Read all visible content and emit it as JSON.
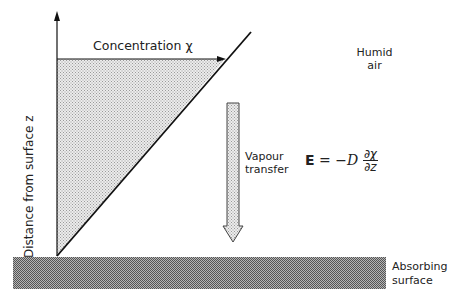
{
  "diagram": {
    "axis_label": "Distance from surface z",
    "concentration_label": "Concentration χ",
    "humid_air": [
      "Humid",
      "air"
    ],
    "vapour_transfer": [
      "Vapour",
      "transfer"
    ],
    "equation": {
      "lhs": "E",
      "equals": "=",
      "coef": "−D",
      "numerator": "∂χ",
      "denominator": "∂z"
    },
    "absorbing_surface": [
      "Absorbing",
      "surface"
    ],
    "colors": {
      "line": "#111111",
      "stipple_fill": "#d4d4d4",
      "surface_fill": "#8a8a8a"
    }
  }
}
